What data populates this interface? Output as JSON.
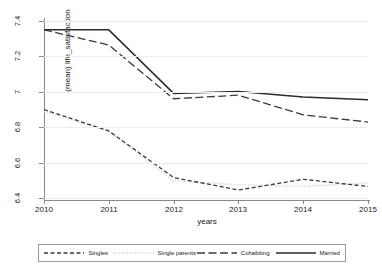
{
  "chart_data": {
    "type": "line",
    "title": "",
    "xlabel": "years",
    "ylabel": "(mean) life_satisfaction",
    "x": [
      2010,
      2011,
      2012,
      2013,
      2014,
      2015
    ],
    "xtick_labels": [
      "2010",
      "2011",
      "2012",
      "2013",
      "2014",
      "2015"
    ],
    "ytick_labels": [
      "6.4",
      "6.6",
      "6.8",
      "7",
      "7.2",
      "7.4"
    ],
    "ytick_values": [
      6.4,
      6.6,
      6.8,
      7.0,
      7.2,
      7.4
    ],
    "xlim": [
      2010,
      2015
    ],
    "ylim": [
      6.4,
      7.4
    ],
    "grid": "horizontal",
    "legend_position": "bottom",
    "series": [
      {
        "name": "Singles",
        "style": "short-dash",
        "color": "#3a3a3a",
        "values": [
          6.9,
          6.78,
          6.52,
          6.45,
          6.51,
          6.47
        ]
      },
      {
        "name": "Single parents",
        "style": "dotted",
        "color": "#d2d2d2",
        "values": [
          6.89,
          6.78,
          6.5,
          6.48,
          6.47,
          6.49
        ]
      },
      {
        "name": "Cohabiting",
        "style": "long-dash",
        "color": "#3a3a3a",
        "values": [
          7.345,
          7.26,
          6.96,
          6.98,
          6.87,
          6.83
        ]
      },
      {
        "name": "Married",
        "style": "solid",
        "color": "#2b2b2b",
        "values": [
          7.345,
          7.345,
          6.99,
          7.0,
          6.97,
          6.955
        ]
      }
    ]
  },
  "legend": {
    "entries": [
      {
        "label": "Singles"
      },
      {
        "label": "Single parents"
      },
      {
        "label": "Cohabiting"
      },
      {
        "label": "Married"
      }
    ]
  }
}
